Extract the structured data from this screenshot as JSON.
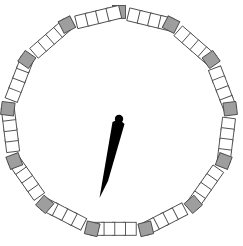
{
  "figure": {
    "name": "polygon-dial",
    "background_color": "#ffffff",
    "width": 243,
    "height": 246
  },
  "dial": {
    "shape": "polygon-ring",
    "sides": 13,
    "center_x": 119,
    "center_y": 122,
    "radius_x": 112,
    "radius_y": 110,
    "rotation_deg": -90,
    "tick_size": 13,
    "ticks_per_edge": 5,
    "vertex_tick_color": "#9e9e9e",
    "edge_tick_color": "#ffffff",
    "tick_outline_color": "#4a4a4a",
    "tick_outline_width": 0.9,
    "total_ticks": 65,
    "vertex_tick_count": 13,
    "edge_tick_count": 52
  },
  "needle": {
    "name": "dial-needle",
    "color": "#000000",
    "pivot_x": 119,
    "pivot_y": 119,
    "tip_x": 101,
    "tip_y": 198,
    "angle_deg": 193,
    "length": 81,
    "max_half_width": 7,
    "hub_radius": 4.2,
    "points": "119,119 112.5,122 99.5,198 108,181 124.5,124"
  },
  "chart_data": {
    "type": "scatter",
    "xlabel": "",
    "ylabel": "",
    "xlim": [
      0,
      243
    ],
    "ylim": [
      246,
      0
    ],
    "grid": false,
    "legend": "none",
    "series": [
      {
        "name": "vertex-ticks",
        "color": "#9e9e9e",
        "count": 13,
        "angles_deg": [
          270,
          297.7,
          325.4,
          353.1,
          20.8,
          48.5,
          76.2,
          103.8,
          131.5,
          159.2,
          186.9,
          214.6,
          242.3
        ]
      },
      {
        "name": "edge-ticks",
        "color": "#ffffff",
        "count": 52
      },
      {
        "name": "needle",
        "color": "#000000",
        "angle_deg": 193,
        "length": 81
      }
    ]
  }
}
